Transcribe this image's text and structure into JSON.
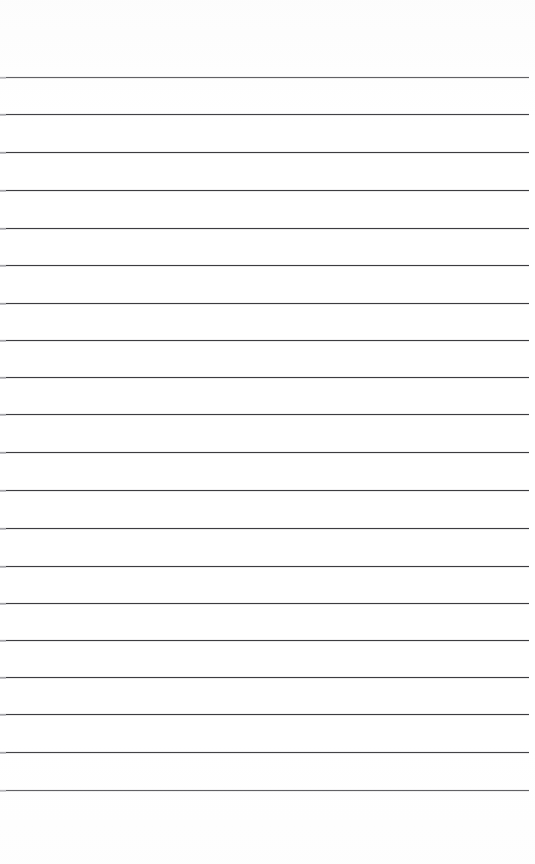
{
  "document": {
    "kind": "ruled-notebook-paper",
    "page_width": 535,
    "page_height": 864,
    "background_color": "#ffffff",
    "has_text_content": false,
    "has_margin_rule": false,
    "has_holes": false
  },
  "rules": {
    "count": 20,
    "stroke_color": "#3c3c40",
    "left_tick_color": "#b9b9bd",
    "thickness_px": 1.3,
    "x_start": 0,
    "x_end": 529,
    "first_line_y": 77,
    "spacing_px": 37.5,
    "top_margin_px": 77,
    "bottom_margin_px": 74,
    "lines": [
      {
        "index": 1,
        "y": 77,
        "x_start": 0,
        "x_end": 529
      },
      {
        "index": 2,
        "y": 114,
        "x_start": 0,
        "x_end": 529
      },
      {
        "index": 3,
        "y": 152,
        "x_start": 0,
        "x_end": 529
      },
      {
        "index": 4,
        "y": 190,
        "x_start": 0,
        "x_end": 529
      },
      {
        "index": 5,
        "y": 228,
        "x_start": 0,
        "x_end": 529
      },
      {
        "index": 6,
        "y": 265,
        "x_start": 0,
        "x_end": 529
      },
      {
        "index": 7,
        "y": 303,
        "x_start": 0,
        "x_end": 529
      },
      {
        "index": 8,
        "y": 340,
        "x_start": 0,
        "x_end": 529
      },
      {
        "index": 9,
        "y": 377,
        "x_start": 0,
        "x_end": 529
      },
      {
        "index": 10,
        "y": 414,
        "x_start": 0,
        "x_end": 529
      },
      {
        "index": 11,
        "y": 452,
        "x_start": 0,
        "x_end": 529
      },
      {
        "index": 12,
        "y": 490,
        "x_start": 0,
        "x_end": 529
      },
      {
        "index": 13,
        "y": 528,
        "x_start": 0,
        "x_end": 529
      },
      {
        "index": 14,
        "y": 566,
        "x_start": 0,
        "x_end": 529
      },
      {
        "index": 15,
        "y": 603,
        "x_start": 0,
        "x_end": 529
      },
      {
        "index": 16,
        "y": 640,
        "x_start": 0,
        "x_end": 529
      },
      {
        "index": 17,
        "y": 677,
        "x_start": 0,
        "x_end": 529
      },
      {
        "index": 18,
        "y": 714,
        "x_start": 0,
        "x_end": 529
      },
      {
        "index": 19,
        "y": 752,
        "x_start": 0,
        "x_end": 529
      },
      {
        "index": 20,
        "y": 790,
        "x_start": 0,
        "x_end": 529
      }
    ]
  },
  "accessibility": {
    "page_description": "Blank ruled notebook paper page with twenty horizontal lines and no written content"
  }
}
